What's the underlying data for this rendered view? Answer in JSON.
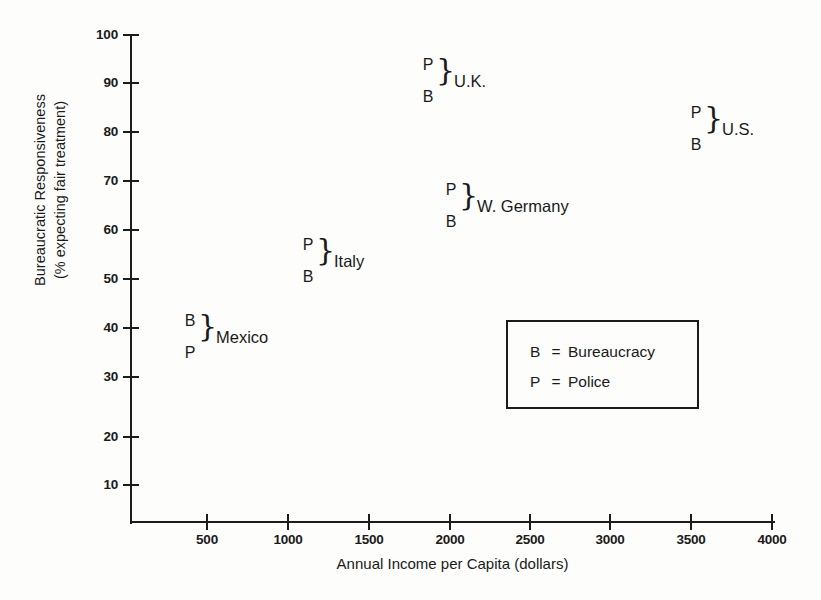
{
  "chart_data": {
    "type": "scatter",
    "title": "",
    "xlabel": "Annual Income per Capita (dollars)",
    "ylabel": "Bureaucratic Responsiveness\n(% expecting fair treatment)",
    "ylabel_line1": "Bureaucratic Responsiveness",
    "ylabel_line2": "(% expecting fair treatment)",
    "xlim": [
      0,
      4000
    ],
    "ylim": [
      0,
      100
    ],
    "xticks": [
      500,
      1000,
      1500,
      2000,
      2500,
      3000,
      3500,
      4000
    ],
    "xtick_labels": [
      "500",
      "1000",
      "1500",
      "2000",
      "2500",
      "3000",
      "3500",
      "4000"
    ],
    "yticks": [
      10,
      20,
      30,
      40,
      50,
      60,
      70,
      80,
      90,
      100
    ],
    "ytick_labels": [
      "10",
      "20",
      "30",
      "40",
      "50",
      "60",
      "70",
      "80",
      "90",
      "100"
    ],
    "grid": false,
    "legend_position": "inside-lower-right",
    "series": [
      {
        "name": "Police",
        "key": "P",
        "values": [
          38,
          57,
          93,
          73,
          83
        ]
      },
      {
        "name": "Bureaucracy",
        "key": "B",
        "values": [
          42,
          52,
          90,
          68,
          79
        ]
      }
    ],
    "categories": [
      "Mexico",
      "Italy",
      "U.K.",
      "W. Germany",
      "U.S."
    ],
    "x": [
      400,
      1150,
      1850,
      2000,
      3500
    ],
    "points": [
      {
        "country": "Mexico",
        "income": 400,
        "P": 38,
        "B": 42,
        "upper_key": "B",
        "lower_key": "P"
      },
      {
        "country": "Italy",
        "income": 1150,
        "P": 57,
        "B": 52,
        "upper_key": "P",
        "lower_key": "B"
      },
      {
        "country": "U.K.",
        "income": 1850,
        "P": 93,
        "B": 90,
        "upper_key": "P",
        "lower_key": "B"
      },
      {
        "country": "W. Germany",
        "income": 2000,
        "P": 73,
        "B": 68,
        "upper_key": "P",
        "lower_key": "B"
      },
      {
        "country": "U.S.",
        "income": 3500,
        "P": 83,
        "B": 79,
        "upper_key": "P",
        "lower_key": "B"
      }
    ]
  },
  "axes": {
    "y": {
      "title_line1": "Bureaucratic Responsiveness",
      "title_line2": "(% expecting fair treatment)",
      "ticks": [
        {
          "label": "100",
          "value": 100,
          "y": 35
        },
        {
          "label": "90",
          "value": 90,
          "y": 83
        },
        {
          "label": "80",
          "value": 80,
          "y": 132
        },
        {
          "label": "70",
          "value": 70,
          "y": 181
        },
        {
          "label": "60",
          "value": 60,
          "y": 230
        },
        {
          "label": "50",
          "value": 50,
          "y": 279
        },
        {
          "label": "40",
          "value": 40,
          "y": 328
        },
        {
          "label": "30",
          "value": 30,
          "y": 377
        },
        {
          "label": "20",
          "value": 20,
          "y": 437
        },
        {
          "label": "10",
          "value": 10,
          "y": 485
        }
      ]
    },
    "x": {
      "title": "Annual Income per Capita (dollars)",
      "ticks": [
        {
          "label": "500",
          "value": 500,
          "x": 207
        },
        {
          "label": "1000",
          "value": 1000,
          "x": 288
        },
        {
          "label": "1500",
          "value": 1500,
          "x": 369
        },
        {
          "label": "2000",
          "value": 2000,
          "x": 450
        },
        {
          "label": "2500",
          "value": 2500,
          "x": 530
        },
        {
          "label": "3000",
          "value": 3000,
          "x": 610
        },
        {
          "label": "3500",
          "value": 3500,
          "x": 691
        },
        {
          "label": "4000",
          "value": 4000,
          "x": 772
        }
      ]
    }
  },
  "markers": [
    {
      "country": "Mexico",
      "upper_letter": "B",
      "lower_letter": "P",
      "left": 182,
      "upper_top": 313,
      "lower_top": 345,
      "brace_left": 198,
      "brace_top": 311,
      "name_left": 216,
      "name_top": 329
    },
    {
      "country": "Italy",
      "upper_letter": "P",
      "lower_letter": "B",
      "left": 300,
      "upper_top": 237,
      "lower_top": 269,
      "brace_left": 316,
      "brace_top": 235,
      "name_left": 334,
      "name_top": 253
    },
    {
      "country": "U.K.",
      "upper_letter": "P",
      "lower_letter": "B",
      "left": 420,
      "upper_top": 57,
      "lower_top": 89,
      "brace_left": 436,
      "brace_top": 55,
      "name_left": 454,
      "name_top": 73
    },
    {
      "country": "W. Germany",
      "upper_letter": "P",
      "lower_letter": "B",
      "left": 443,
      "upper_top": 182,
      "lower_top": 214,
      "brace_left": 459,
      "brace_top": 180,
      "name_left": 477,
      "name_top": 198
    },
    {
      "country": "U.S.",
      "upper_letter": "P",
      "lower_letter": "B",
      "left": 688,
      "upper_top": 105,
      "lower_top": 137,
      "brace_left": 704,
      "brace_top": 103,
      "name_left": 722,
      "name_top": 121
    }
  ],
  "legend": {
    "rows": [
      {
        "key": "B",
        "eq": "=",
        "label": "Bureaucracy",
        "top": 22
      },
      {
        "key": "P",
        "eq": "=",
        "label": "Police",
        "top": 52
      }
    ]
  },
  "colors": {
    "ink": "#1c1c1c",
    "background": "#fdfdfb"
  }
}
